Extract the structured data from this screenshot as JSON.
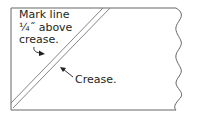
{
  "diagram": {
    "type": "sewing-instruction",
    "labels": {
      "mark_line": [
        "Mark line",
        "¼˝ above",
        "crease."
      ],
      "crease": "Crease."
    },
    "colors": {
      "outline": "#555555",
      "text": "#231f20"
    }
  }
}
